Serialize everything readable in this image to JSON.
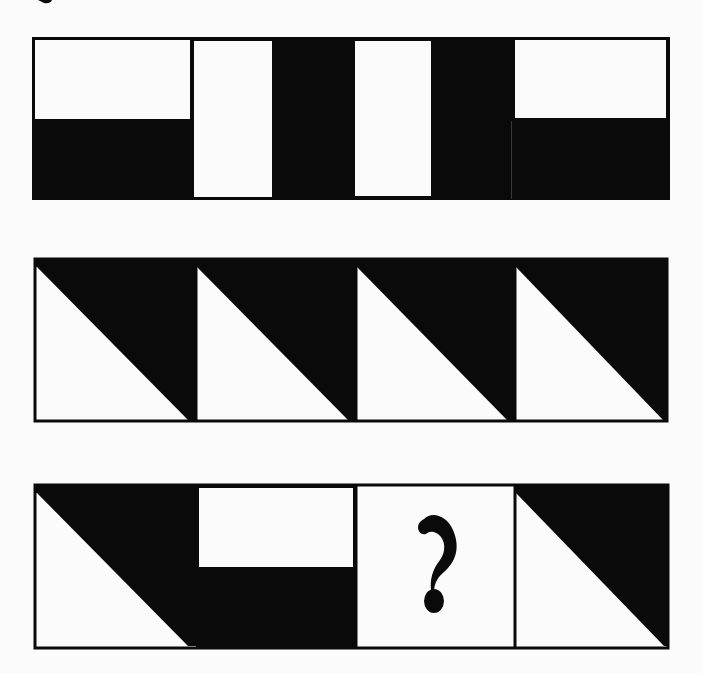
{
  "puzzle": {
    "colors": {
      "ink": "#0a0a0a",
      "paper": "#fbfbfb"
    },
    "rows": [
      {
        "name": "row-1",
        "panels": [
          {
            "name": "panel-1-1",
            "pattern": "white-top-half-black-bottom"
          },
          {
            "name": "panel-1-2",
            "pattern": "white-column"
          },
          {
            "name": "panel-1-3",
            "pattern": "black-column"
          },
          {
            "name": "panel-1-4",
            "pattern": "white-column"
          },
          {
            "name": "panel-1-5",
            "pattern": "black-column"
          },
          {
            "name": "panel-1-6",
            "pattern": "white-top-half-black-bottom"
          }
        ]
      },
      {
        "name": "row-2",
        "panels": [
          {
            "name": "panel-2-1",
            "pattern": "black-upper-right-triangle"
          },
          {
            "name": "panel-2-2",
            "pattern": "black-upper-right-triangle"
          },
          {
            "name": "panel-2-3",
            "pattern": "black-upper-right-triangle"
          },
          {
            "name": "panel-2-4",
            "pattern": "black-upper-right-triangle"
          }
        ]
      },
      {
        "name": "row-3",
        "panels": [
          {
            "name": "panel-3-1",
            "pattern": "black-upper-right-triangle"
          },
          {
            "name": "panel-3-2",
            "pattern": "white-top-half-black-bottom"
          },
          {
            "name": "panel-3-3",
            "pattern": "unknown",
            "label": "?"
          },
          {
            "name": "panel-3-4",
            "pattern": "black-upper-right-triangle"
          }
        ]
      }
    ],
    "missing_label": "?"
  }
}
